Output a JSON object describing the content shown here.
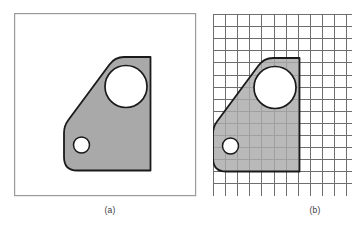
{
  "figure": {
    "background_color": "#ffffff"
  },
  "panels": [
    {
      "id": "panel-a",
      "caption": "(a)",
      "frame": {
        "x": 14,
        "y": 13,
        "width": 182,
        "height": 183,
        "fill": "#ffffff",
        "stroke": "#9a9a9a",
        "stroke_width": 1.2
      },
      "grid": null
    },
    {
      "id": "panel-b",
      "caption": "(b)",
      "frame": {
        "x": 213,
        "y": 14,
        "width": 139,
        "height": 182,
        "fill": "#ffffff",
        "stroke": "#6e6e6e",
        "stroke_width": 1.0
      },
      "grid": {
        "cell_size": 12.1,
        "columns": 12,
        "rows": 15,
        "line_color": "#6e6e6e",
        "line_width": 1.0,
        "visible": true,
        "note": "grid is clipped by the right edge of the image"
      }
    }
  ],
  "shape": {
    "name": "bracket-plate",
    "fill_color": "#a9a9a9",
    "stroke_color": "#1a1a1a",
    "stroke_width": 1.8,
    "fill_opacity_over_grid": 0.82,
    "outline_points_panel_a": [
      [
        150.5,
        57.0
      ],
      [
        115.0,
        57.0
      ],
      [
        64.0,
        126.0
      ],
      [
        64.0,
        158.0
      ],
      [
        74.0,
        170.5
      ],
      [
        150.5,
        170.5
      ]
    ],
    "corner_radii": {
      "top_left_apex": 9,
      "left_elbow": 9,
      "bottom_left": 13,
      "bottom_right": 0,
      "top_right": 0
    },
    "holes": [
      {
        "name": "large-hole",
        "center_panel_a": [
          126.0,
          86.5
        ],
        "radius": 21.0,
        "fill": "#ffffff"
      },
      {
        "name": "small-hole",
        "center_panel_a": [
          81.5,
          145.0
        ],
        "radius": 8.0,
        "fill": "#ffffff"
      }
    ],
    "panel_b_offset_x": 149.0,
    "panel_b_offset_y": 1.0
  },
  "captions": {
    "a": "(a)",
    "b": "(b)"
  }
}
